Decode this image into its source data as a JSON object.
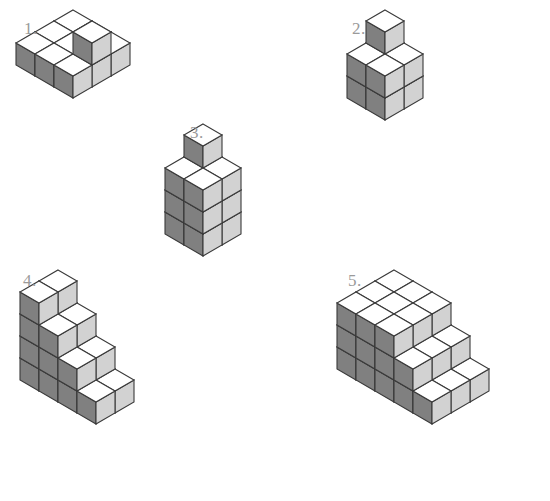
{
  "page": {
    "background_color": "#ffffff",
    "width": 550,
    "height": 501
  },
  "style": {
    "top_face_color": "#ffffff",
    "left_face_color": "#808080",
    "right_face_color": "#d2d2d2",
    "edge_color": "#3a3a3a",
    "label_color": "#9a9a9a",
    "edge_width": 1.1,
    "cube_half_width": 19,
    "cube_height": 22,
    "cube_top_rise": 11
  },
  "figures": [
    {
      "id": "figure-1",
      "label": "1.",
      "label_x": 24,
      "label_y": 20,
      "origin_x": 14,
      "origin_y": 8,
      "width": 250,
      "height": 130,
      "description": "Three by three flat layer with one extra cube raised",
      "cubes": [
        [
          0,
          0,
          0
        ],
        [
          1,
          0,
          0
        ],
        [
          2,
          0,
          0
        ],
        [
          0,
          1,
          0
        ],
        [
          1,
          1,
          0
        ],
        [
          2,
          1,
          0
        ],
        [
          0,
          2,
          0
        ],
        [
          1,
          2,
          0
        ],
        [
          2,
          2,
          0
        ],
        [
          2,
          1,
          1
        ]
      ]
    },
    {
      "id": "figure-2",
      "label": "2.",
      "label_x": 352,
      "label_y": 20,
      "origin_x": 345,
      "origin_y": 8,
      "width": 190,
      "height": 130,
      "description": "Two by two base two high with one tower cube on the back left",
      "cubes": [
        [
          0,
          0,
          0
        ],
        [
          1,
          0,
          0
        ],
        [
          0,
          1,
          0
        ],
        [
          1,
          1,
          0
        ],
        [
          0,
          0,
          1
        ],
        [
          1,
          0,
          1
        ],
        [
          0,
          1,
          1
        ],
        [
          1,
          1,
          1
        ],
        [
          0,
          0,
          2
        ]
      ]
    },
    {
      "id": "figure-3",
      "label": "3.",
      "label_x": 190,
      "label_y": 124,
      "origin_x": 163,
      "origin_y": 122,
      "width": 185,
      "height": 170,
      "description": "Two by two by three block with one cube on top at the back",
      "cubes": [
        [
          0,
          0,
          0
        ],
        [
          1,
          0,
          0
        ],
        [
          0,
          1,
          0
        ],
        [
          1,
          1,
          0
        ],
        [
          0,
          0,
          1
        ],
        [
          1,
          0,
          1
        ],
        [
          0,
          1,
          1
        ],
        [
          1,
          1,
          1
        ],
        [
          0,
          0,
          2
        ],
        [
          1,
          0,
          2
        ],
        [
          0,
          1,
          2
        ],
        [
          1,
          1,
          2
        ],
        [
          0,
          0,
          3
        ]
      ]
    },
    {
      "id": "figure-4",
      "label": "4.",
      "label_x": 23,
      "label_y": 272,
      "origin_x": 18,
      "origin_y": 268,
      "width": 235,
      "height": 185,
      "description": "Descending staircase four columns deep stepping down to the right",
      "cubes": [
        [
          0,
          0,
          0
        ],
        [
          0,
          0,
          1
        ],
        [
          0,
          0,
          2
        ],
        [
          0,
          0,
          3
        ],
        [
          0,
          1,
          0
        ],
        [
          0,
          1,
          1
        ],
        [
          0,
          1,
          2
        ],
        [
          0,
          1,
          3
        ],
        [
          1,
          1,
          0
        ],
        [
          1,
          1,
          1
        ],
        [
          1,
          1,
          2
        ],
        [
          2,
          1,
          0
        ],
        [
          2,
          1,
          1
        ],
        [
          3,
          1,
          0
        ],
        [
          1,
          0,
          0
        ],
        [
          1,
          0,
          1
        ],
        [
          1,
          0,
          2
        ],
        [
          2,
          0,
          0
        ],
        [
          2,
          0,
          1
        ],
        [
          3,
          0,
          0
        ]
      ]
    },
    {
      "id": "figure-5",
      "label": "5.",
      "label_x": 348,
      "label_y": 272,
      "origin_x": 335,
      "origin_y": 268,
      "width": 215,
      "height": 233,
      "description": "Three by three by three block with a descending two step extension on the right",
      "cubes": [
        [
          0,
          0,
          0
        ],
        [
          0,
          0,
          1
        ],
        [
          0,
          0,
          2
        ],
        [
          1,
          0,
          0
        ],
        [
          1,
          0,
          1
        ],
        [
          1,
          0,
          2
        ],
        [
          2,
          0,
          0
        ],
        [
          2,
          0,
          1
        ],
        [
          2,
          0,
          2
        ],
        [
          0,
          1,
          0
        ],
        [
          0,
          1,
          1
        ],
        [
          0,
          1,
          2
        ],
        [
          1,
          1,
          0
        ],
        [
          1,
          1,
          1
        ],
        [
          1,
          1,
          2
        ],
        [
          2,
          1,
          0
        ],
        [
          2,
          1,
          1
        ],
        [
          2,
          1,
          2
        ],
        [
          0,
          2,
          0
        ],
        [
          0,
          2,
          1
        ],
        [
          0,
          2,
          2
        ],
        [
          1,
          2,
          0
        ],
        [
          1,
          2,
          1
        ],
        [
          1,
          2,
          2
        ],
        [
          2,
          2,
          0
        ],
        [
          2,
          2,
          1
        ],
        [
          2,
          2,
          2
        ],
        [
          3,
          0,
          0
        ],
        [
          3,
          0,
          1
        ],
        [
          3,
          1,
          0
        ],
        [
          3,
          1,
          1
        ],
        [
          3,
          2,
          0
        ],
        [
          3,
          2,
          1
        ],
        [
          4,
          0,
          0
        ],
        [
          4,
          1,
          0
        ],
        [
          4,
          2,
          0
        ]
      ]
    }
  ]
}
